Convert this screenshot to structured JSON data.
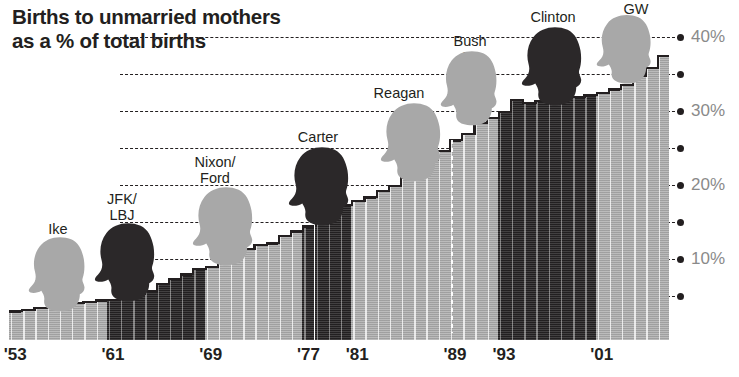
{
  "title": "Births to unmarried mothers\nas a % of total births",
  "chart_data": {
    "type": "bar",
    "title": "Births to unmarried mothers as a % of total births",
    "xlabel": "",
    "ylabel": "% of total births",
    "ylim": [
      0,
      42
    ],
    "grid": true,
    "legend_position": "none",
    "y_ticks": [
      5,
      10,
      15,
      20,
      25,
      30,
      35,
      40
    ],
    "y_tick_labels": [
      "",
      "10%",
      "",
      "20%",
      "",
      "30%",
      "",
      "40%"
    ],
    "x_tick_labels": [
      "'53",
      "'61",
      "'69",
      "'77",
      "'81",
      "'89",
      "'93",
      "'01"
    ],
    "x_tick_years": [
      1953,
      1961,
      1969,
      1977,
      1981,
      1989,
      1993,
      2001
    ],
    "categories": [
      1953,
      1954,
      1955,
      1956,
      1957,
      1958,
      1959,
      1960,
      1961,
      1962,
      1963,
      1964,
      1965,
      1966,
      1967,
      1968,
      1969,
      1970,
      1971,
      1972,
      1973,
      1974,
      1975,
      1976,
      1977,
      1978,
      1979,
      1980,
      1981,
      1982,
      1983,
      1984,
      1985,
      1986,
      1987,
      1988,
      1989,
      1990,
      1991,
      1992,
      1993,
      1994,
      1995,
      1996,
      1997,
      1998,
      1999,
      2000,
      2001,
      2002,
      2003,
      2004,
      2005,
      2006
    ],
    "values": [
      4.0,
      4.2,
      4.5,
      4.7,
      4.9,
      5.1,
      5.3,
      5.5,
      5.6,
      5.9,
      6.3,
      6.8,
      7.7,
      8.4,
      9.0,
      9.7,
      10.0,
      10.7,
      11.3,
      12.4,
      13.0,
      13.2,
      14.2,
      14.8,
      15.5,
      16.3,
      17.1,
      18.4,
      18.9,
      19.4,
      20.3,
      21.0,
      22.0,
      23.4,
      24.5,
      25.7,
      27.1,
      28.0,
      29.5,
      30.1,
      31.0,
      32.6,
      32.2,
      32.4,
      32.4,
      32.8,
      33.0,
      33.2,
      33.5,
      34.0,
      34.6,
      35.8,
      36.9,
      38.5
    ],
    "series_note": "Annual share of U.S. births to unmarried mothers, 1953-2006",
    "bar_colors_by_party": {
      "republican": "#a8a8a8",
      "democrat": "#2d2a2b"
    },
    "presidential_terms": [
      {
        "id": "ike",
        "label": "Ike",
        "party": "republican",
        "start": 1953,
        "end": 1960
      },
      {
        "id": "jfk-lbj",
        "label": "JFK/\nLBJ",
        "party": "democrat",
        "start": 1961,
        "end": 1968
      },
      {
        "id": "nixon-ford",
        "label": "Nixon/\nFord",
        "party": "republican",
        "start": 1969,
        "end": 1976
      },
      {
        "id": "carter",
        "label": "Carter",
        "party": "democrat",
        "start": 1977,
        "end": 1980
      },
      {
        "id": "reagan",
        "label": "Reagan",
        "party": "republican",
        "start": 1981,
        "end": 1988
      },
      {
        "id": "bush-sr",
        "label": "Bush Sr.",
        "party": "republican",
        "start": 1989,
        "end": 1992
      },
      {
        "id": "clinton",
        "label": "Clinton",
        "party": "democrat",
        "start": 1993,
        "end": 2000
      },
      {
        "id": "gw",
        "label": "GW",
        "party": "republican",
        "start": 2001,
        "end": 2006
      }
    ]
  },
  "president_annotations": [
    {
      "id": "ike",
      "label": "Ike",
      "party": "republican",
      "name_x": 58,
      "name_y": 222,
      "head_x": 58,
      "head_y": 236,
      "head_w": 62,
      "head_h": 78
    },
    {
      "id": "jfk-lbj",
      "label": "JFK/\nLBJ",
      "party": "democrat",
      "name_x": 122,
      "name_y": 192,
      "head_x": 126,
      "head_y": 222,
      "head_w": 66,
      "head_h": 82
    },
    {
      "id": "nixon-ford",
      "label": "Nixon/\nFord",
      "party": "republican",
      "name_x": 215,
      "name_y": 155,
      "head_x": 224,
      "head_y": 186,
      "head_w": 66,
      "head_h": 82
    },
    {
      "id": "carter",
      "label": "Carter",
      "party": "democrat",
      "name_x": 318,
      "name_y": 130,
      "head_x": 320,
      "head_y": 146,
      "head_w": 66,
      "head_h": 82
    },
    {
      "id": "reagan",
      "label": "Reagan",
      "party": "republican",
      "name_x": 399,
      "name_y": 86,
      "head_x": 412,
      "head_y": 102,
      "head_w": 66,
      "head_h": 82
    },
    {
      "id": "bush-sr",
      "label": "Bush Sr.",
      "party": "republican",
      "name_x": 470,
      "name_y": 34,
      "head_x": 470,
      "head_y": 50,
      "head_w": 62,
      "head_h": 78
    },
    {
      "id": "clinton",
      "label": "Clinton",
      "party": "democrat",
      "name_x": 553,
      "name_y": 10,
      "head_x": 553,
      "head_y": 26,
      "head_w": 66,
      "head_h": 82
    },
    {
      "id": "gw",
      "label": "GW",
      "party": "republican",
      "name_x": 636,
      "name_y": 2,
      "head_x": 625,
      "head_y": 14,
      "head_w": 60,
      "head_h": 72
    }
  ]
}
